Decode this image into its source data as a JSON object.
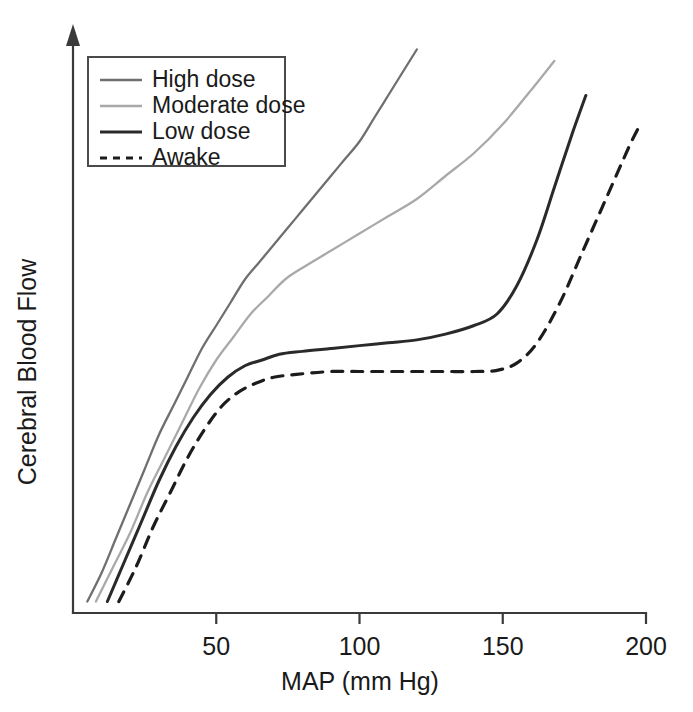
{
  "chart_data": {
    "type": "line",
    "title": "",
    "xlabel": "MAP (mm Hg)",
    "ylabel": "Cerebral Blood Flow",
    "xlim": [
      0,
      200
    ],
    "ylim": [
      0,
      100
    ],
    "xticks": [
      50,
      100,
      150,
      200
    ],
    "xticklabels": [
      "50",
      "100",
      "150",
      "200"
    ],
    "yticks": [],
    "yticklabels": [],
    "grid": false,
    "legend_position": "upper-left",
    "series": [
      {
        "name": "High dose",
        "color": "#6f6f6f",
        "linestyle": "solid",
        "linewidth": 2.3,
        "x": [
          5,
          10,
          15,
          20,
          25,
          30,
          35,
          40,
          45,
          50,
          55,
          60,
          65,
          70,
          75,
          80,
          85,
          90,
          95,
          100,
          105,
          110,
          115,
          120
        ],
        "y": [
          2,
          7,
          13,
          19,
          25,
          31,
          36,
          41,
          46,
          50,
          54,
          58,
          61,
          64,
          67,
          70,
          73,
          76,
          79,
          82,
          86,
          90,
          94,
          98
        ]
      },
      {
        "name": "Moderate dose",
        "color": "#a9a9a9",
        "linestyle": "solid",
        "linewidth": 2.3,
        "x": [
          8,
          14,
          20,
          26,
          32,
          38,
          44,
          50,
          56,
          62,
          68,
          74,
          80,
          90,
          100,
          110,
          120,
          130,
          140,
          150,
          160,
          168
        ],
        "y": [
          2,
          8,
          14,
          21,
          27,
          33,
          39,
          44,
          48,
          52,
          55,
          58,
          60,
          63,
          66,
          69,
          72,
          76,
          80,
          85,
          91,
          96
        ]
      },
      {
        "name": "Low dose",
        "color": "#2a2a2a",
        "linestyle": "solid",
        "linewidth": 3.0,
        "x": [
          12,
          18,
          24,
          30,
          36,
          42,
          48,
          54,
          60,
          66,
          72,
          80,
          90,
          100,
          110,
          120,
          130,
          140,
          148,
          155,
          162,
          168,
          174,
          179
        ],
        "y": [
          2,
          9,
          16,
          23,
          29,
          34,
          38,
          41,
          43,
          44,
          45,
          45.5,
          46,
          46.5,
          47,
          47.5,
          48.5,
          50,
          52,
          57,
          65,
          74,
          83,
          90
        ]
      },
      {
        "name": "Awake",
        "color": "#1c1c1c",
        "linestyle": "dashed",
        "linewidth": 3.2,
        "dash": "11,9",
        "x": [
          16,
          22,
          28,
          34,
          40,
          46,
          52,
          58,
          64,
          70,
          78,
          90,
          100,
          110,
          120,
          130,
          140,
          148,
          155,
          162,
          170,
          178,
          186,
          194,
          198
        ],
        "y": [
          2,
          8,
          15,
          21,
          27,
          32,
          36,
          38.5,
          40,
          41,
          41.5,
          42,
          42,
          42,
          42,
          42,
          42,
          42.2,
          43.5,
          47,
          54,
          63,
          72,
          81,
          85
        ]
      }
    ]
  },
  "legend": {
    "items": [
      {
        "label": "High dose"
      },
      {
        "label": "Moderate dose"
      },
      {
        "label": "Low dose"
      },
      {
        "label": "Awake"
      }
    ]
  },
  "axes": {
    "x_title": "MAP (mm Hg)",
    "y_title": "Cerebral Blood Flow"
  }
}
